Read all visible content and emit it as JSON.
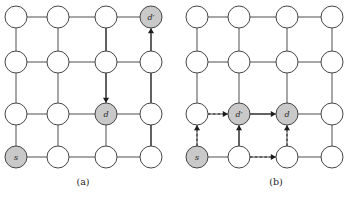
{
  "figure": {
    "grid": {
      "rows": 4,
      "cols": 4
    },
    "colors": {
      "node_fill": "#ffffff",
      "node_shaded_fill": "#c9c9c9",
      "node_stroke": "#3b3b3b",
      "edge": "#3b3b3b",
      "arrow": "#1c1c1c",
      "background": "#ffffff",
      "text": "#1c1c1c"
    },
    "geometry": {
      "node_radius": 11,
      "col_x": [
        16,
        58,
        106,
        151
      ],
      "row_y": [
        17,
        62,
        114,
        157
      ]
    }
  },
  "panels": [
    {
      "id": "a",
      "caption": "(a)",
      "nodes": [
        {
          "row": 0,
          "col": 0,
          "label": "",
          "shaded": false
        },
        {
          "row": 0,
          "col": 1,
          "label": "",
          "shaded": false
        },
        {
          "row": 0,
          "col": 2,
          "label": "",
          "shaded": false
        },
        {
          "row": 0,
          "col": 3,
          "label": "d′",
          "shaded": true
        },
        {
          "row": 1,
          "col": 0,
          "label": "",
          "shaded": false
        },
        {
          "row": 1,
          "col": 1,
          "label": "",
          "shaded": false
        },
        {
          "row": 1,
          "col": 2,
          "label": "",
          "shaded": false
        },
        {
          "row": 1,
          "col": 3,
          "label": "",
          "shaded": false
        },
        {
          "row": 2,
          "col": 0,
          "label": "",
          "shaded": false
        },
        {
          "row": 2,
          "col": 1,
          "label": "",
          "shaded": false
        },
        {
          "row": 2,
          "col": 2,
          "label": "d",
          "shaded": true
        },
        {
          "row": 2,
          "col": 3,
          "label": "",
          "shaded": false
        },
        {
          "row": 3,
          "col": 0,
          "label": "s",
          "shaded": true
        },
        {
          "row": 3,
          "col": 1,
          "label": "",
          "shaded": false
        },
        {
          "row": 3,
          "col": 2,
          "label": "",
          "shaded": false
        },
        {
          "row": 3,
          "col": 3,
          "label": "",
          "shaded": false
        }
      ],
      "arrows": [
        {
          "name": "arrow-down-to-d",
          "from": {
            "row": 0,
            "col": 2
          },
          "to": {
            "row": 2,
            "col": 2
          },
          "style": "solid",
          "direction": "down"
        },
        {
          "name": "arrow-up-to-dprime",
          "from": {
            "row": 3,
            "col": 3
          },
          "to": {
            "row": 0,
            "col": 3
          },
          "style": "solid",
          "direction": "up"
        }
      ]
    },
    {
      "id": "b",
      "caption": "(b)",
      "nodes": [
        {
          "row": 0,
          "col": 0,
          "label": "",
          "shaded": false
        },
        {
          "row": 0,
          "col": 1,
          "label": "",
          "shaded": false
        },
        {
          "row": 0,
          "col": 2,
          "label": "",
          "shaded": false
        },
        {
          "row": 0,
          "col": 3,
          "label": "",
          "shaded": false
        },
        {
          "row": 1,
          "col": 0,
          "label": "",
          "shaded": false
        },
        {
          "row": 1,
          "col": 1,
          "label": "",
          "shaded": false
        },
        {
          "row": 1,
          "col": 2,
          "label": "",
          "shaded": false
        },
        {
          "row": 1,
          "col": 3,
          "label": "",
          "shaded": false
        },
        {
          "row": 2,
          "col": 0,
          "label": "",
          "shaded": false
        },
        {
          "row": 2,
          "col": 1,
          "label": "d′",
          "shaded": true
        },
        {
          "row": 2,
          "col": 2,
          "label": "d",
          "shaded": true
        },
        {
          "row": 2,
          "col": 3,
          "label": "",
          "shaded": false
        },
        {
          "row": 3,
          "col": 0,
          "label": "s",
          "shaded": true
        },
        {
          "row": 3,
          "col": 1,
          "label": "",
          "shaded": false
        },
        {
          "row": 3,
          "col": 2,
          "label": "",
          "shaded": false
        },
        {
          "row": 3,
          "col": 3,
          "label": "",
          "shaded": false
        }
      ],
      "arrows": [
        {
          "name": "arrow-up-to-dprime",
          "from": {
            "row": 3,
            "col": 1
          },
          "to": {
            "row": 2,
            "col": 1
          },
          "style": "solid",
          "direction": "up"
        },
        {
          "name": "arrow-right-to-d",
          "from": {
            "row": 2,
            "col": 1
          },
          "to": {
            "row": 2,
            "col": 2
          },
          "style": "solid",
          "direction": "right"
        },
        {
          "name": "arrow-dashed-up-to-d",
          "from": {
            "row": 3,
            "col": 2
          },
          "to": {
            "row": 2,
            "col": 2
          },
          "style": "dashed",
          "direction": "up"
        },
        {
          "name": "arrow-dashed-right-to-dprime",
          "from": {
            "row": 2,
            "col": 0
          },
          "to": {
            "row": 2,
            "col": 1
          },
          "style": "dashed",
          "direction": "right"
        },
        {
          "name": "arrow-dashed-up-from-s",
          "from": {
            "row": 3,
            "col": 0
          },
          "to": {
            "row": 2,
            "col": 0
          },
          "style": "dashed",
          "direction": "up"
        },
        {
          "name": "arrow-dashed-right-from-s-neighbor",
          "from": {
            "row": 3,
            "col": 1
          },
          "to": {
            "row": 3,
            "col": 2
          },
          "style": "dashed",
          "direction": "right"
        }
      ]
    }
  ]
}
